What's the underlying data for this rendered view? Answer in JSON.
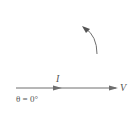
{
  "diagram": {
    "type": "phasor-diagram",
    "phasors": [
      {
        "label": "I",
        "angle_deg": 0,
        "description": "current phasor (shorter)"
      },
      {
        "label": "V",
        "angle_deg": 0,
        "description": "voltage phasor (longer)"
      }
    ],
    "angle_label": "θ = 0°",
    "rotation_indicator": "counterclockwise",
    "colors": {
      "line": "#6e6e6e",
      "text": "#555555"
    }
  }
}
